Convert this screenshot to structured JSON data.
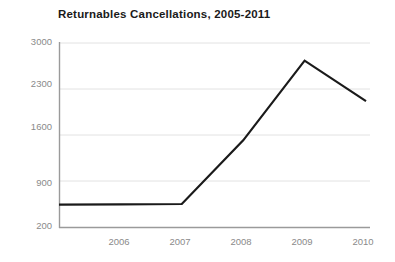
{
  "chart_data": {
    "type": "line",
    "title": "Returnables Cancellations, 2005-2011",
    "xlabel": "",
    "ylabel": "",
    "x": [
      2005,
      2006,
      2007,
      2008,
      2009,
      2010
    ],
    "values": [
      540,
      545,
      550,
      1520,
      2730,
      2115
    ],
    "series": [
      {
        "name": "Returnables Cancellations",
        "values": [
          540,
          545,
          550,
          1520,
          2730,
          2115
        ]
      }
    ],
    "xlim": [
      2005,
      2010
    ],
    "ylim": [
      200,
      3000
    ],
    "y_ticks": [
      200,
      900,
      1600,
      2300,
      3000
    ],
    "y_tick_labels": [
      "200",
      "900",
      "1600",
      "2300",
      "3000"
    ],
    "x_ticks": [
      2006,
      2007,
      2008,
      2009,
      2010
    ],
    "x_tick_labels": [
      "2006",
      "2007",
      "2008",
      "2009",
      "2010"
    ],
    "grid": true,
    "legend": false,
    "line_color": "#1a1a1a",
    "grid_color": "#e2e2e2",
    "axis_color": "#9a9a9a",
    "label_color": "#8a8a8a",
    "background_color": "#ffffff"
  }
}
